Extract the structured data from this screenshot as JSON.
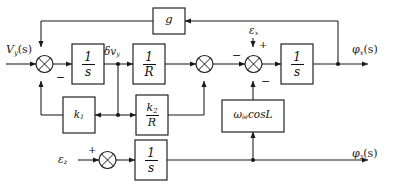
{
  "diagram": {
    "type": "control-block-diagram",
    "width": 398,
    "height": 186,
    "line_color": "#1a1a1a",
    "background": "#ffffff"
  },
  "inputs": {
    "velocity_input": "V",
    "velocity_input_sub": "y",
    "velocity_input_arg": "(s)",
    "epsilon_bottom": "ε",
    "epsilon_bottom_sub": "z",
    "epsilon_top": "ε",
    "epsilon_top_sub": "x"
  },
  "outputs": {
    "phi_top": "φ",
    "phi_top_sub": "x",
    "phi_top_arg": "(s)",
    "phi_bottom": "φ",
    "phi_bottom_sub": "z",
    "phi_bottom_arg": "(s)"
  },
  "signals": {
    "delta_v": "δv",
    "delta_v_sub": "y"
  },
  "blocks": [
    {
      "id": "integrator_1",
      "numerator": "1",
      "denominator": "s",
      "kind": "fraction"
    },
    {
      "id": "gain_inv_R",
      "numerator": "1",
      "denominator": "R",
      "kind": "fraction"
    },
    {
      "id": "gain_k1",
      "label": "k",
      "sub": "1",
      "kind": "scalar"
    },
    {
      "id": "gain_k2_over_R",
      "numerator": "k",
      "numerator_sub": "2",
      "denominator": "R",
      "kind": "fraction"
    },
    {
      "id": "gain_g",
      "label": "g",
      "kind": "scalar"
    },
    {
      "id": "earth_rate",
      "label": "ω",
      "sub": "ie",
      "suffix": "cosL",
      "kind": "scalar"
    },
    {
      "id": "integrator_2",
      "numerator": "1",
      "denominator": "s",
      "kind": "fraction"
    },
    {
      "id": "integrator_3",
      "numerator": "1",
      "denominator": "s",
      "kind": "fraction"
    }
  ],
  "summing_junctions": [
    {
      "id": "sum_1",
      "signs": {
        "bottom": "−"
      }
    },
    {
      "id": "sum_2",
      "signs": {}
    },
    {
      "id": "sum_3",
      "signs": {
        "left": "−",
        "top": "+",
        "bottom": "−"
      }
    },
    {
      "id": "sum_4",
      "signs": {
        "top": "+"
      }
    }
  ]
}
